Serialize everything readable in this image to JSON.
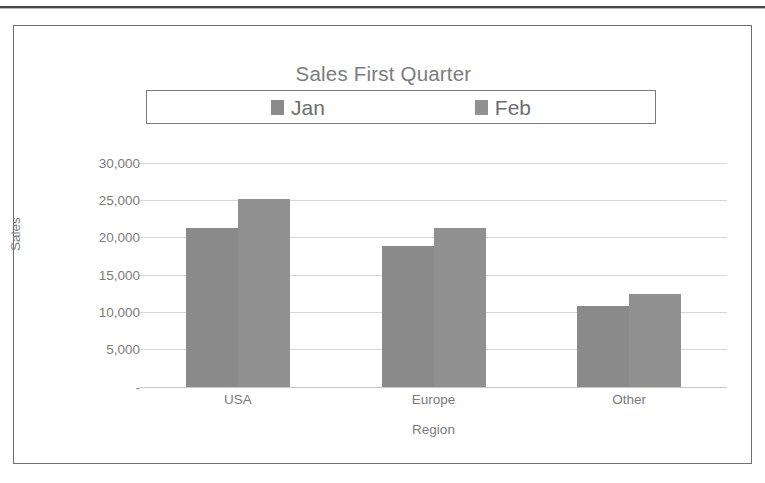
{
  "chart_data": {
    "type": "bar",
    "title": "Sales First Quarter",
    "xlabel": "Region",
    "ylabel": "Sales",
    "categories": [
      "USA",
      "Europe",
      "Other"
    ],
    "series": [
      {
        "name": "Jan",
        "values": [
          21300,
          18900,
          10850
        ],
        "color": "#8a8a8a"
      },
      {
        "name": "Feb",
        "values": [
          25200,
          21300,
          12450
        ],
        "color": "#909090"
      }
    ],
    "ylim": [
      0,
      30000
    ],
    "ytick_values": [
      0,
      5000,
      10000,
      15000,
      20000,
      25000,
      30000
    ],
    "ytick_labels": [
      "-",
      "5,000",
      "10,000",
      "15,000",
      "20,000",
      "25,000",
      "30,000"
    ],
    "grid": true,
    "legend_position": "top",
    "bar_gap_within_group": 0
  },
  "chart": {
    "title": "Sales First Quarter",
    "legend": {
      "entries": [
        {
          "label": "Jan",
          "swatch": "legend-swatch-jan"
        },
        {
          "label": "Feb",
          "swatch": "legend-swatch-feb"
        }
      ]
    },
    "y_axis": {
      "title": "Sales",
      "ticks": [
        "30,000",
        "25,000",
        "20,000",
        "15,000",
        "10,000",
        "5,000",
        "-"
      ]
    },
    "x_axis": {
      "title": "Region",
      "ticks": [
        "USA",
        "Europe",
        "Other"
      ]
    }
  },
  "colors": {
    "series_jan": "#8a8a8a",
    "series_feb": "#909090",
    "text": "#7b7b7b",
    "gridline": "#d6d6d6",
    "frame": "#6f6f6f"
  }
}
